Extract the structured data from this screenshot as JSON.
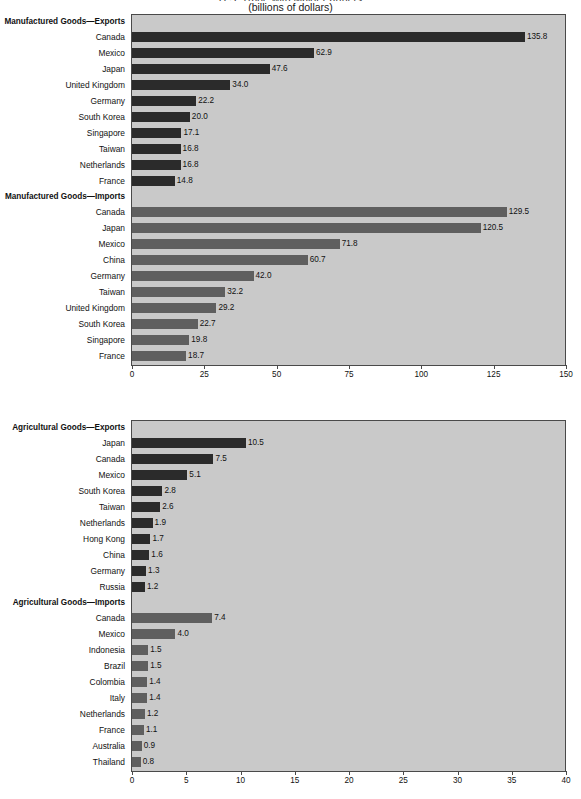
{
  "title": {
    "main": "U.S. Trade with Major Partners",
    "sub": "(billions of dollars)"
  },
  "chart_data": [
    {
      "type": "bar",
      "orientation": "horizontal",
      "title": "(billions of dollars)",
      "xlabel": "",
      "ylabel": "",
      "xlim": [
        0,
        150
      ],
      "xticks": [
        0,
        25,
        50,
        75,
        100,
        125,
        150
      ],
      "grid": false,
      "legend": "none",
      "sections": [
        {
          "name": "Manufactured Goods—Exports",
          "style": "exports",
          "color": "#2b2b2b",
          "categories": [
            "Canada",
            "Mexico",
            "Japan",
            "United Kingdom",
            "Germany",
            "South Korea",
            "Singapore",
            "Taiwan",
            "Netherlands",
            "France"
          ],
          "values": [
            135.8,
            62.9,
            47.6,
            34.0,
            22.2,
            20.0,
            17.1,
            16.8,
            16.8,
            14.8
          ],
          "labels": [
            "135.8",
            "62.9",
            "47.6",
            "34.0",
            "22.2",
            "20.0",
            "17.1",
            "16.8",
            "16.8",
            "14.8"
          ]
        },
        {
          "name": "Manufactured Goods—Imports",
          "style": "imports",
          "color": "#5f5f5f",
          "categories": [
            "Canada",
            "Japan",
            "Mexico",
            "China",
            "Germany",
            "Taiwan",
            "United Kingdom",
            "South Korea",
            "Singapore",
            "France"
          ],
          "values": [
            129.5,
            120.5,
            71.8,
            60.7,
            42.0,
            32.2,
            29.2,
            22.7,
            19.8,
            18.7
          ],
          "labels": [
            "129.5",
            "120.5",
            "71.8",
            "60.7",
            "42.0",
            "32.2",
            "29.2",
            "22.7",
            "19.8",
            "18.7"
          ]
        }
      ]
    },
    {
      "type": "bar",
      "orientation": "horizontal",
      "title": "",
      "xlabel": "",
      "ylabel": "",
      "xlim": [
        0,
        40
      ],
      "xticks": [
        0,
        5,
        10,
        15,
        20,
        25,
        30,
        35,
        40
      ],
      "grid": false,
      "legend": "none",
      "sections": [
        {
          "name": "Agricultural Goods—Exports",
          "style": "exports",
          "color": "#2b2b2b",
          "categories": [
            "Japan",
            "Canada",
            "Mexico",
            "South Korea",
            "Taiwan",
            "Netherlands",
            "Hong Kong",
            "China",
            "Germany",
            "Russia"
          ],
          "values": [
            10.5,
            7.5,
            5.1,
            2.8,
            2.6,
            1.9,
            1.7,
            1.6,
            1.3,
            1.2
          ],
          "labels": [
            "10.5",
            "7.5",
            "5.1",
            "2.8",
            "2.6",
            "1.9",
            "1.7",
            "1.6",
            "1.3",
            "1.2"
          ]
        },
        {
          "name": "Agricultural Goods—Imports",
          "style": "imports",
          "color": "#5f5f5f",
          "categories": [
            "Canada",
            "Mexico",
            "Indonesia",
            "Brazil",
            "Colombia",
            "Italy",
            "Netherlands",
            "France",
            "Australia",
            "Thailand"
          ],
          "values": [
            7.4,
            4.0,
            1.5,
            1.5,
            1.4,
            1.4,
            1.2,
            1.1,
            0.9,
            0.8
          ],
          "labels": [
            "7.4",
            "4.0",
            "1.5",
            "1.5",
            "1.4",
            "1.4",
            "1.2",
            "1.1",
            "0.9",
            "0.8"
          ]
        }
      ]
    }
  ]
}
